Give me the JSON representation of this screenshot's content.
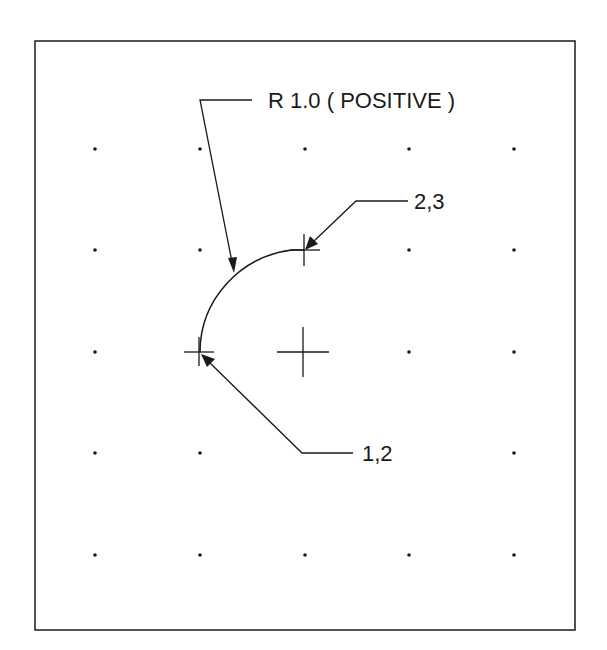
{
  "diagram": {
    "radius_label": "R 1.0 ( POSITIVE )",
    "point_end_label": "2,3",
    "point_start_label": "1,2",
    "colors": {
      "ink": "#1a1a1a",
      "background": "#ffffff"
    },
    "grid": {
      "columns_x": [
        95,
        200,
        305,
        409,
        514
      ],
      "rows_y": [
        149,
        250,
        352,
        453,
        555
      ]
    }
  }
}
